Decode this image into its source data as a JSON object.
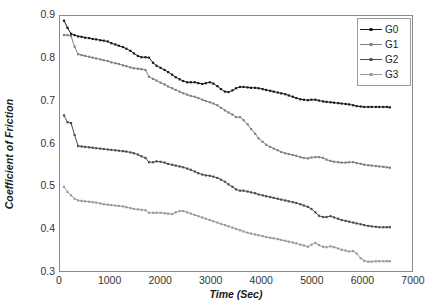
{
  "chart_data": {
    "type": "line",
    "title": "",
    "xlabel": "Time (Sec)",
    "ylabel": "Coefficient of Friction",
    "xlim": [
      0,
      7000
    ],
    "ylim": [
      0.3,
      0.9
    ],
    "xticks": [
      "0",
      "1000",
      "2000",
      "3000",
      "4000",
      "5000",
      "6000",
      "7000"
    ],
    "yticks": [
      "0.9",
      "0.8",
      "0.7",
      "0.6",
      "0.5",
      "0.4",
      "0.3"
    ],
    "grid": false,
    "legend_position": "top-right",
    "legend": [
      "G0",
      "G1",
      "G2",
      "G3"
    ],
    "colors": {
      "G0": "#1a1a1a",
      "G1": "#808080",
      "G2": "#4d4d4d",
      "G3": "#9a9a9a",
      "frame": "#8a8a8a",
      "background": "#ffffff"
    },
    "x": [
      80,
      150,
      220,
      290,
      360,
      430,
      500,
      580,
      650,
      720,
      800,
      870,
      950,
      1020,
      1100,
      1170,
      1250,
      1320,
      1400,
      1470,
      1550,
      1620,
      1700,
      1770,
      1850,
      1920,
      2000,
      2080,
      2150,
      2230,
      2300,
      2380,
      2450,
      2530,
      2600,
      2680,
      2750,
      2830,
      2900,
      2980,
      3050,
      3130,
      3200,
      3280,
      3350,
      3430,
      3500,
      3580,
      3650,
      3730,
      3800,
      3880,
      3950,
      4030,
      4100,
      4180,
      4250,
      4330,
      4400,
      4480,
      4550,
      4630,
      4700,
      4780,
      4850,
      4930,
      5000,
      5080,
      5150,
      5230,
      5300,
      5380,
      5450,
      5530,
      5600,
      5680,
      5750,
      5830,
      5900,
      5980,
      6050,
      6130,
      6200,
      6280,
      6350,
      6430,
      6500,
      6560
    ],
    "series": [
      {
        "name": "G0",
        "values": [
          0.889,
          0.872,
          0.858,
          0.855,
          0.852,
          0.851,
          0.849,
          0.848,
          0.846,
          0.845,
          0.843,
          0.842,
          0.84,
          0.836,
          0.833,
          0.83,
          0.827,
          0.823,
          0.818,
          0.812,
          0.806,
          0.803,
          0.803,
          0.802,
          0.79,
          0.783,
          0.778,
          0.773,
          0.768,
          0.762,
          0.756,
          0.751,
          0.747,
          0.744,
          0.744,
          0.744,
          0.742,
          0.74,
          0.742,
          0.744,
          0.741,
          0.735,
          0.728,
          0.722,
          0.721,
          0.725,
          0.73,
          0.733,
          0.733,
          0.732,
          0.731,
          0.731,
          0.73,
          0.728,
          0.726,
          0.724,
          0.722,
          0.72,
          0.718,
          0.716,
          0.713,
          0.71,
          0.707,
          0.704,
          0.703,
          0.702,
          0.703,
          0.703,
          0.701,
          0.699,
          0.698,
          0.697,
          0.696,
          0.695,
          0.694,
          0.693,
          0.692,
          0.69,
          0.688,
          0.687,
          0.686,
          0.686,
          0.686,
          0.686,
          0.686,
          0.686,
          0.686,
          0.685
        ]
      },
      {
        "name": "G1",
        "values": [
          0.855,
          0.855,
          0.853,
          0.828,
          0.81,
          0.808,
          0.806,
          0.804,
          0.802,
          0.8,
          0.798,
          0.796,
          0.794,
          0.791,
          0.789,
          0.787,
          0.784,
          0.782,
          0.779,
          0.777,
          0.776,
          0.775,
          0.773,
          0.757,
          0.752,
          0.748,
          0.743,
          0.739,
          0.734,
          0.73,
          0.726,
          0.722,
          0.718,
          0.715,
          0.712,
          0.71,
          0.707,
          0.703,
          0.7,
          0.697,
          0.694,
          0.69,
          0.684,
          0.678,
          0.673,
          0.668,
          0.662,
          0.662,
          0.655,
          0.645,
          0.634,
          0.623,
          0.612,
          0.604,
          0.597,
          0.592,
          0.588,
          0.584,
          0.58,
          0.577,
          0.575,
          0.573,
          0.571,
          0.568,
          0.566,
          0.565,
          0.567,
          0.568,
          0.568,
          0.566,
          0.562,
          0.559,
          0.557,
          0.556,
          0.555,
          0.555,
          0.556,
          0.556,
          0.554,
          0.552,
          0.55,
          0.549,
          0.548,
          0.547,
          0.546,
          0.545,
          0.544,
          0.543
        ]
      },
      {
        "name": "G2",
        "values": [
          0.666,
          0.65,
          0.648,
          0.62,
          0.594,
          0.593,
          0.592,
          0.591,
          0.59,
          0.589,
          0.588,
          0.587,
          0.586,
          0.585,
          0.584,
          0.583,
          0.582,
          0.581,
          0.579,
          0.577,
          0.574,
          0.57,
          0.566,
          0.556,
          0.556,
          0.558,
          0.557,
          0.555,
          0.552,
          0.55,
          0.548,
          0.546,
          0.544,
          0.541,
          0.538,
          0.534,
          0.53,
          0.527,
          0.525,
          0.524,
          0.522,
          0.519,
          0.515,
          0.51,
          0.504,
          0.498,
          0.492,
          0.489,
          0.489,
          0.487,
          0.485,
          0.483,
          0.48,
          0.478,
          0.476,
          0.474,
          0.472,
          0.47,
          0.468,
          0.466,
          0.464,
          0.462,
          0.46,
          0.457,
          0.454,
          0.451,
          0.446,
          0.438,
          0.43,
          0.427,
          0.427,
          0.429,
          0.426,
          0.423,
          0.42,
          0.418,
          0.416,
          0.414,
          0.412,
          0.41,
          0.408,
          0.406,
          0.405,
          0.404,
          0.403,
          0.403,
          0.403,
          0.403
        ]
      },
      {
        "name": "G3",
        "values": [
          0.498,
          0.486,
          0.478,
          0.47,
          0.466,
          0.465,
          0.464,
          0.463,
          0.462,
          0.461,
          0.459,
          0.457,
          0.456,
          0.455,
          0.454,
          0.453,
          0.452,
          0.45,
          0.448,
          0.446,
          0.445,
          0.444,
          0.443,
          0.437,
          0.437,
          0.437,
          0.437,
          0.436,
          0.435,
          0.434,
          0.438,
          0.441,
          0.441,
          0.438,
          0.435,
          0.432,
          0.429,
          0.426,
          0.423,
          0.42,
          0.417,
          0.414,
          0.411,
          0.408,
          0.405,
          0.402,
          0.399,
          0.396,
          0.393,
          0.39,
          0.388,
          0.386,
          0.384,
          0.382,
          0.38,
          0.378,
          0.377,
          0.375,
          0.373,
          0.371,
          0.369,
          0.367,
          0.365,
          0.362,
          0.36,
          0.357,
          0.362,
          0.366,
          0.361,
          0.357,
          0.356,
          0.358,
          0.356,
          0.353,
          0.35,
          0.348,
          0.346,
          0.347,
          0.341,
          0.33,
          0.324,
          0.322,
          0.322,
          0.323,
          0.323,
          0.323,
          0.323,
          0.323
        ]
      }
    ]
  }
}
